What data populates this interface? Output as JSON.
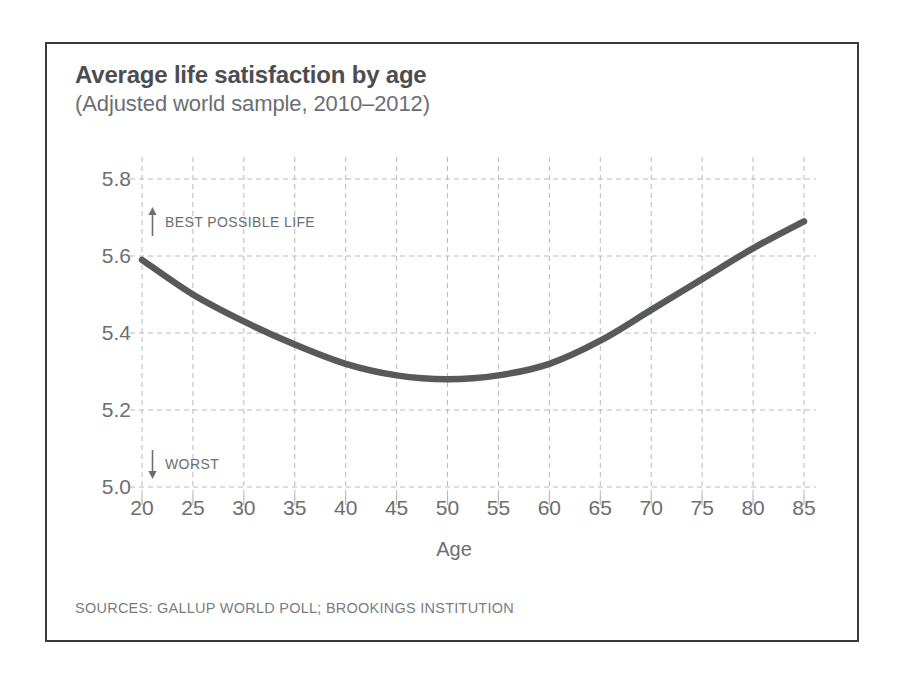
{
  "header": {
    "title": "Average life satisfaction by age",
    "subtitle": "(Adjusted world sample, 2010–2012)"
  },
  "annotations": {
    "best": {
      "label": "BEST POSSIBLE LIFE",
      "icon": "arrow-up-icon"
    },
    "worst": {
      "label": "WORST",
      "icon": "arrow-down-icon"
    }
  },
  "source": "SOURCES: GALLUP WORLD POLL; BROOKINGS INSTITUTION",
  "colors": {
    "line": "#58595b",
    "grid": "#b9b9bb",
    "text": "#6d6e71",
    "frame": "#3a3a3c",
    "background": "#ffffff"
  },
  "chart_data": {
    "type": "line",
    "title": "Average life satisfaction by age",
    "subtitle": "(Adjusted world sample, 2010–2012)",
    "xlabel": "Age",
    "ylabel": "",
    "xlim": [
      20,
      85
    ],
    "ylim": [
      5.0,
      5.8
    ],
    "xticks": [
      20,
      25,
      30,
      35,
      40,
      45,
      50,
      55,
      60,
      65,
      70,
      75,
      80,
      85
    ],
    "yticks": [
      "5.0",
      "5.2",
      "5.4",
      "5.6",
      "5.8"
    ],
    "grid": true,
    "grid_style": "dashed",
    "legend": "none",
    "series": [
      {
        "name": "Average life satisfaction",
        "x": [
          20,
          25,
          30,
          35,
          40,
          45,
          50,
          55,
          60,
          65,
          70,
          75,
          80,
          85
        ],
        "values": [
          5.59,
          5.5,
          5.43,
          5.37,
          5.32,
          5.29,
          5.28,
          5.29,
          5.32,
          5.38,
          5.46,
          5.54,
          5.62,
          5.69
        ]
      }
    ]
  }
}
